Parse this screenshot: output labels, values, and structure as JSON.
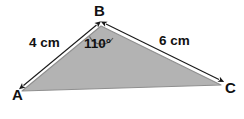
{
  "figure": {
    "type": "triangle-with-labeled-sides-and-angle",
    "background_color": "#ffffff",
    "fill_color": "#b3b3b3",
    "outline_color": "#8a8a8a",
    "annotation_color": "#1a1a1a"
  },
  "vertices": [
    {
      "id": "A",
      "label": "A",
      "x": 22,
      "y": 91
    },
    {
      "id": "B",
      "label": "B",
      "x": 101,
      "y": 26
    },
    {
      "id": "C",
      "label": "C",
      "x": 221,
      "y": 85
    }
  ],
  "sides": [
    {
      "id": "AB",
      "label": "4 cm",
      "value": 4,
      "unit": "cm",
      "from": "A",
      "to": "B"
    },
    {
      "id": "BC",
      "label": "6 cm",
      "value": 6,
      "unit": "cm",
      "from": "B",
      "to": "C"
    },
    {
      "id": "AC",
      "label": "",
      "from": "A",
      "to": "C"
    }
  ],
  "angles": [
    {
      "id": "B",
      "label": "110°",
      "value": 110,
      "unit": "degrees",
      "at_vertex": "B"
    }
  ],
  "icons": {
    "arrow_ab": "double-headed-arrow-icon",
    "arrow_bc": "double-headed-arrow-icon",
    "angle_arc": "angle-arc-icon"
  }
}
